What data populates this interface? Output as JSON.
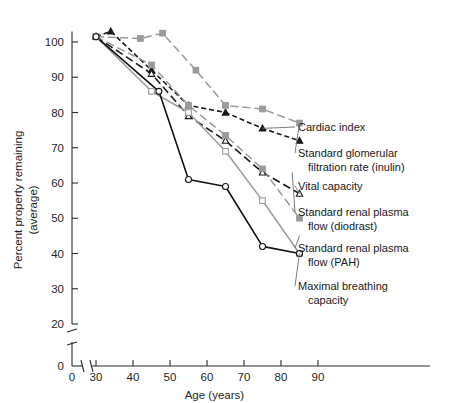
{
  "figure": {
    "background_color": "#ffffff",
    "width": 450,
    "height": 403
  },
  "axes": {
    "x": {
      "title": "Age (years)",
      "ticks": [
        30,
        40,
        50,
        60,
        70,
        80,
        90
      ],
      "tick_labels": [
        "30",
        "40",
        "50",
        "60",
        "70",
        "80",
        "90"
      ],
      "origin_label": "0",
      "has_axis_break": true,
      "break_between": [
        0,
        30
      ],
      "range": [
        30,
        90
      ]
    },
    "y": {
      "title_line1": "Percent property remaining",
      "title_line2": "(average)",
      "ticks": [
        0,
        20,
        30,
        40,
        50,
        60,
        70,
        80,
        90,
        100
      ],
      "tick_labels": [
        "0",
        "20",
        "30",
        "40",
        "50",
        "60",
        "70",
        "80",
        "90",
        "100"
      ],
      "has_axis_break": true,
      "break_between": [
        0,
        20
      ],
      "range": [
        20,
        103
      ]
    }
  },
  "callouts": [
    {
      "id": "cardiac-index",
      "lines": [
        "Cardiac index"
      ]
    },
    {
      "id": "standard-glomerular-filtration-rate",
      "lines": [
        "Standard glomerular",
        "filtration rate (inulin)"
      ]
    },
    {
      "id": "vital-capacity",
      "lines": [
        "Vital capacity"
      ]
    },
    {
      "id": "standard-renal-plasma-flow-diodrast",
      "lines": [
        "Standard renal plasma",
        "flow (diodrast)"
      ]
    },
    {
      "id": "standard-renal-plasma-flow-pah",
      "lines": [
        "Standard renal plasma",
        "flow (PAH)"
      ]
    },
    {
      "id": "maximal-breathing-capacity",
      "lines": [
        "Maximal breathing",
        "capacity"
      ]
    }
  ],
  "chart_data": {
    "type": "line",
    "title": "",
    "xlabel": "Age (years)",
    "ylabel": "Percent property remaining (average)",
    "xlim": [
      30,
      90
    ],
    "ylim": [
      20,
      103
    ],
    "grid": false,
    "legend_position": "right-callouts",
    "series": [
      {
        "name": "Cardiac index",
        "color": "#1a1a1a",
        "style": "dashed-short",
        "marker": "triangle-filled",
        "x": [
          30,
          34,
          45,
          55,
          65,
          75,
          85
        ],
        "y": [
          101.5,
          103,
          92,
          82,
          80,
          75.5,
          72
        ]
      },
      {
        "name": "Standard glomerular filtration rate (inulin)",
        "color": "#9a9a9a",
        "style": "dashed-long",
        "marker": "square-filled",
        "x": [
          30,
          42,
          48,
          57,
          65,
          75,
          85
        ],
        "y": [
          101.5,
          101,
          102.5,
          92,
          82,
          81,
          77
        ]
      },
      {
        "name": "Vital capacity",
        "color": "#1a1a1a",
        "style": "dashed-long",
        "marker": "triangle-open",
        "x": [
          30,
          45,
          55,
          65,
          75,
          85
        ],
        "y": [
          101.5,
          91,
          79,
          72,
          63,
          57
        ]
      },
      {
        "name": "Standard renal plasma flow (diodrast)",
        "color": "#9a9a9a",
        "style": "dashed-long",
        "marker": "square-filled",
        "x": [
          30,
          45,
          55,
          65,
          75,
          85
        ],
        "y": [
          101.5,
          93.5,
          82,
          73.5,
          64,
          50
        ]
      },
      {
        "name": "Standard renal plasma flow (PAH)",
        "color": "#9a9a9a",
        "style": "solid",
        "marker": "square-open",
        "x": [
          30,
          45,
          55,
          65,
          75,
          85
        ],
        "y": [
          101.5,
          86,
          80,
          69,
          55,
          40
        ]
      },
      {
        "name": "Maximal breathing capacity",
        "color": "#111111",
        "style": "solid",
        "marker": "circle-open",
        "x": [
          30,
          47,
          55,
          65,
          75,
          85
        ],
        "y": [
          101.5,
          86,
          61,
          59,
          42,
          40
        ]
      }
    ]
  }
}
